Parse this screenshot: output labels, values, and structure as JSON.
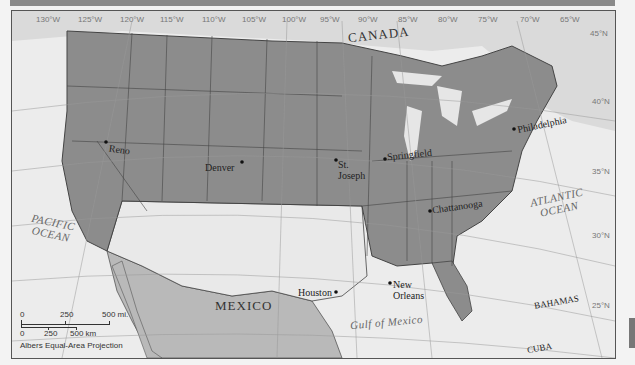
{
  "map": {
    "projection": "Albers Equal-Area Projection",
    "colors": {
      "us_states_shaded": "#8c8c8c",
      "us_states_unshaded": "#e9e9e9",
      "mexico": "#b9b9b9",
      "canada": "#dadada",
      "water": "#ececec",
      "borders": "#444444",
      "graticule": "#999999"
    },
    "longitudes": [
      "130°W",
      "125°W",
      "120°W",
      "115°W",
      "110°W",
      "105°W",
      "100°W",
      "95°W",
      "90°W",
      "85°W",
      "80°W",
      "75°W",
      "70°W",
      "65°W"
    ],
    "latitudes": [
      "45°N",
      "40°N",
      "35°N",
      "30°N",
      "25°N"
    ],
    "countries": {
      "canada": "CANADA",
      "mexico": "MEXICO",
      "bahamas": "BAHAMAS",
      "cuba": "CUBA"
    },
    "water_bodies": {
      "pacific": [
        "PACIFIC",
        "OCEAN"
      ],
      "atlantic": [
        "ATLANTIC",
        "OCEAN"
      ],
      "gulf": "Gulf of Mexico"
    },
    "cities": {
      "reno": "Reno",
      "denver": "Denver",
      "st_joseph": [
        "St.",
        "Joseph"
      ],
      "springfield": "Springfield",
      "philadelphia": "Philadelphia",
      "chattanooga": "Chattanooga",
      "houston": "Houston",
      "new_orleans": [
        "New",
        "Orleans"
      ]
    },
    "scale_bar": {
      "miles": [
        "0",
        "250",
        "500 mi."
      ],
      "km": [
        "0",
        "250",
        "500 km"
      ]
    }
  }
}
